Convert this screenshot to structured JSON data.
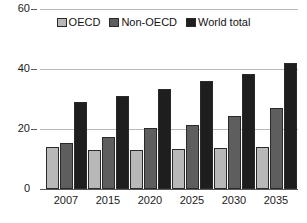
{
  "chart_data": {
    "type": "bar",
    "title": "",
    "subtitle": "",
    "xlabel": "",
    "ylabel": "",
    "categories": [
      "2007",
      "2015",
      "2020",
      "2025",
      "2030",
      "2035"
    ],
    "series": [
      {
        "name": "OECD",
        "color": "#b8b8b8",
        "values": [
          14,
          13,
          13,
          13.5,
          13.8,
          14
        ]
      },
      {
        "name": "Non-OECD",
        "color": "#5e5e5e",
        "values": [
          15.5,
          17.5,
          20.3,
          21.5,
          24.5,
          27
        ]
      },
      {
        "name": "World total",
        "color": "#1e1e1e",
        "values": [
          29,
          31,
          33.5,
          36,
          38.5,
          42
        ]
      }
    ],
    "ylim": [
      0,
      60
    ],
    "yticks": [
      0,
      20,
      40,
      60
    ],
    "ytick_labels": [
      "0",
      "20",
      "40",
      "60"
    ],
    "grid": true,
    "grid_axis": "y",
    "legend_position": "top-center",
    "legend": [
      "OECD",
      "Non-OECD",
      "World total"
    ]
  },
  "axes": {
    "y": {
      "ticks": [
        {
          "value": 60,
          "label": "60"
        },
        {
          "value": 40,
          "label": "40"
        },
        {
          "value": 20,
          "label": "20"
        },
        {
          "value": 0,
          "label": "0"
        }
      ]
    },
    "x": {
      "ticks": [
        {
          "label": "2007"
        },
        {
          "label": "2015"
        },
        {
          "label": "2020"
        },
        {
          "label": "2025"
        },
        {
          "label": "2030"
        },
        {
          "label": "2035"
        }
      ]
    }
  },
  "legend": {
    "items": [
      {
        "label": "OECD",
        "color": "#b8b8b8"
      },
      {
        "label": "Non-OECD",
        "color": "#5e5e5e"
      },
      {
        "label": "World total",
        "color": "#1e1e1e"
      }
    ]
  }
}
